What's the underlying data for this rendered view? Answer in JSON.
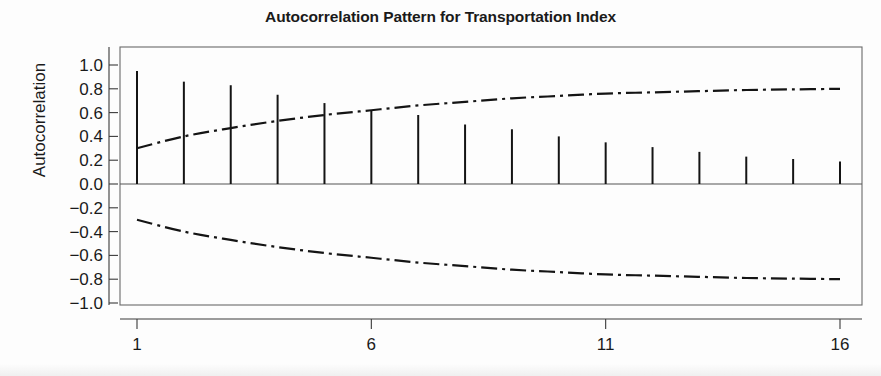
{
  "chart_data": {
    "type": "bar",
    "title": "Autocorrelation Pattern for Transportation Index",
    "xlabel": "",
    "ylabel": "Autocorrelation",
    "subtitle": "",
    "x": [
      1,
      2,
      3,
      4,
      5,
      6,
      7,
      8,
      9,
      10,
      11,
      12,
      13,
      14,
      15,
      16
    ],
    "categories": [
      "1",
      "2",
      "3",
      "4",
      "5",
      "6",
      "7",
      "8",
      "9",
      "10",
      "11",
      "12",
      "13",
      "14",
      "15",
      "16"
    ],
    "values": [
      0.95,
      0.86,
      0.83,
      0.75,
      0.68,
      0.62,
      0.58,
      0.5,
      0.46,
      0.4,
      0.35,
      0.31,
      0.27,
      0.23,
      0.21,
      0.19
    ],
    "series": [
      {
        "name": "Autocorrelation",
        "style": "spike",
        "values": [
          0.95,
          0.86,
          0.83,
          0.75,
          0.68,
          0.62,
          0.58,
          0.5,
          0.46,
          0.4,
          0.35,
          0.31,
          0.27,
          0.23,
          0.21,
          0.19
        ]
      },
      {
        "name": "Upper confidence limit",
        "style": "dash-dot",
        "values": [
          0.3,
          0.4,
          0.47,
          0.53,
          0.58,
          0.62,
          0.66,
          0.69,
          0.72,
          0.74,
          0.76,
          0.77,
          0.78,
          0.79,
          0.795,
          0.8
        ]
      },
      {
        "name": "Lower confidence limit",
        "style": "dash-dot",
        "values": [
          -0.3,
          -0.4,
          -0.47,
          -0.53,
          -0.58,
          -0.62,
          -0.66,
          -0.69,
          -0.72,
          -0.74,
          -0.76,
          -0.77,
          -0.78,
          -0.79,
          -0.795,
          -0.8
        ]
      }
    ],
    "ylim": [
      -1.0,
      1.0
    ],
    "xlim": [
      0.6,
      16.4
    ],
    "yticks": [
      1.0,
      0.8,
      0.6,
      0.4,
      0.2,
      0.0,
      -0.2,
      -0.4,
      -0.6,
      -0.8,
      -1.0
    ],
    "ytick_labels": [
      "1.0",
      "0.8",
      "0.6",
      "0.4",
      "0.2",
      "0.0",
      "-0.2",
      "-0.4",
      "-0.6",
      "-0.8",
      "-1.0"
    ],
    "xticks": [
      1,
      6,
      11,
      16
    ],
    "xtick_labels": [
      "1",
      "6",
      "11",
      "16"
    ],
    "grid": false,
    "legend": "none",
    "zero_line": true,
    "colors": {
      "spike": "#141414",
      "confidence": "#141414",
      "axis": "#3a3a3a",
      "box": "#6a6a6a",
      "background": "#fdfdfd"
    }
  }
}
